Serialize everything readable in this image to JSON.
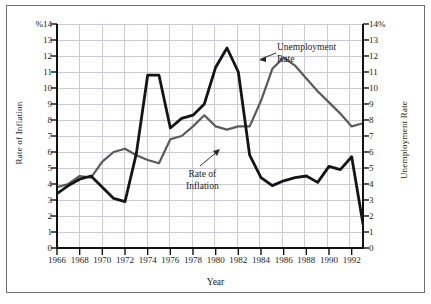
{
  "figure": {
    "x_axis_title": "Year",
    "y_axis_title_left": "Rate of Inflation",
    "y_axis_title_right": "Unemployment Rate",
    "y_tick_labels_left": [
      "%14",
      "13",
      "12",
      "11",
      "10",
      "9",
      "8",
      "7",
      "6",
      "5",
      "4",
      "3",
      "2",
      "1",
      "0"
    ],
    "y_tick_labels_right": [
      "14%",
      "13",
      "12",
      "11",
      "10",
      "9",
      "8",
      "7",
      "6",
      "5",
      "4",
      "3",
      "2",
      "1",
      "0"
    ],
    "x_tick_labels": [
      "1966",
      "1968",
      "1970",
      "1972",
      "1974",
      "1976",
      "1978",
      "1980",
      "1982",
      "1984",
      "1986",
      "1988",
      "1990",
      "1992"
    ],
    "annotations": [
      {
        "name": "unemployment-rate-annotation",
        "line1": "Unemployment",
        "line2": "Rate"
      },
      {
        "name": "inflation-rate-annotation",
        "line1": "Rate of",
        "line2": "Inflation"
      }
    ],
    "colors": {
      "inflation_line": "#141414",
      "unemployment_line": "#5a5a5a",
      "grid": "#c9c9d8",
      "axis": "#111111",
      "page_background": "#c8c8c8",
      "plot_background": "#ffffff",
      "frame_border": "#6e6e6e"
    }
  },
  "chart_data": {
    "type": "line",
    "title": "",
    "xlabel": "Year",
    "ylabel": "Rate of Inflation",
    "ylabel_right": "Unemployment Rate",
    "xlim": [
      1966,
      1993
    ],
    "ylim": [
      0,
      14
    ],
    "grid": true,
    "legend": "annotated-inline",
    "x": [
      1966,
      1967,
      1968,
      1969,
      1970,
      1971,
      1972,
      1973,
      1974,
      1975,
      1976,
      1977,
      1978,
      1979,
      1980,
      1981,
      1982,
      1983,
      1984,
      1985,
      1986,
      1987,
      1988,
      1989,
      1990,
      1991,
      1992,
      1993
    ],
    "series": [
      {
        "name": "Rate of Inflation",
        "color": "#141414",
        "values": [
          3.4,
          3.9,
          4.3,
          4.5,
          3.8,
          3.1,
          2.9,
          5.9,
          10.8,
          10.8,
          7.5,
          8.1,
          8.3,
          9.0,
          11.3,
          12.5,
          11.0,
          5.8,
          4.4,
          3.9,
          4.2,
          4.4,
          4.5,
          4.1,
          5.1,
          4.9,
          5.7,
          1.5
        ]
      },
      {
        "name": "Unemployment Rate",
        "color": "#5a5a5a",
        "values": [
          3.8,
          4.0,
          4.5,
          4.4,
          5.4,
          6.0,
          6.2,
          5.8,
          5.5,
          5.3,
          6.8,
          7.0,
          7.6,
          8.3,
          7.6,
          7.4,
          7.6,
          7.6,
          9.2,
          11.2,
          11.9,
          11.4,
          10.6,
          9.8,
          9.1,
          8.4,
          7.6,
          7.8
        ]
      }
    ]
  }
}
